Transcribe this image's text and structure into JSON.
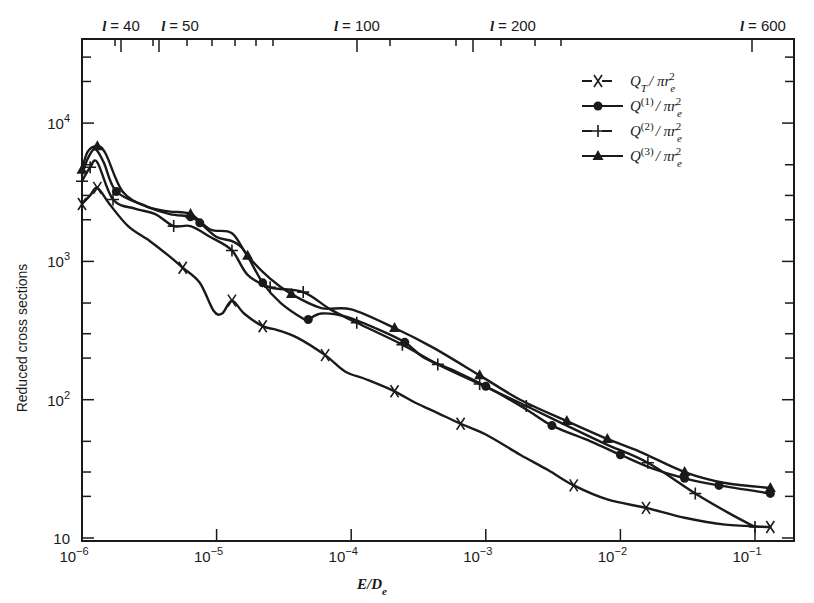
{
  "chart_data": {
    "type": "line",
    "title": "",
    "xlabel": "E/D_e",
    "ylabel": "Reduced cross sections",
    "xscale": "log",
    "yscale": "log",
    "xlim": [
      1e-06,
      0.17
    ],
    "ylim": [
      10,
      40000
    ],
    "x_ticks": [
      {
        "value": 1e-06,
        "label": "10",
        "exp": "−6"
      },
      {
        "value": 1e-05,
        "label": "10",
        "exp": "−5"
      },
      {
        "value": 0.0001,
        "label": "10",
        "exp": "−4"
      },
      {
        "value": 0.001,
        "label": "10",
        "exp": "−3"
      },
      {
        "value": 0.01,
        "label": "10",
        "exp": "−2"
      },
      {
        "value": 0.1,
        "label": "10",
        "exp": "−1"
      }
    ],
    "y_ticks": [
      {
        "value": 10,
        "label": "10",
        "exp": ""
      },
      {
        "value": 100,
        "label": "10",
        "exp": "2"
      },
      {
        "value": 1000,
        "label": "10",
        "exp": "3"
      },
      {
        "value": 10000,
        "label": "10",
        "exp": "4"
      }
    ],
    "top_axis": {
      "variable": "l",
      "labels": [
        {
          "text": "= 40",
          "x_px": 121
        },
        {
          "text": "= 50",
          "x_px": 180
        },
        {
          "text": "= 100",
          "x_px": 357
        },
        {
          "text": "= 200",
          "x_px": 513
        },
        {
          "text": "= 600",
          "x_px": 763
        }
      ],
      "ticks_px": [
        115,
        153,
        187,
        212,
        235,
        256,
        273,
        390,
        456,
        501,
        535,
        561
      ]
    },
    "legend": {
      "position": "upper right",
      "entries": [
        {
          "marker": "x",
          "label": "Q_T / πr_e²",
          "main": "Q",
          "sub": "T",
          "sup": "",
          "rest": "/ πr",
          "esub": "e",
          "esup": "2"
        },
        {
          "marker": "circle",
          "label": "Q^(1) / πr_e²",
          "main": "Q",
          "sub": "",
          "sup": "(1)",
          "rest": "/ πr",
          "esub": "e",
          "esup": "2"
        },
        {
          "marker": "plus",
          "label": "Q^(2) / πr_e²",
          "main": "Q",
          "sub": "",
          "sup": "(2)",
          "rest": "/ πr",
          "esub": "e",
          "esup": "2"
        },
        {
          "marker": "triangle",
          "label": "Q^(3) / πr_e²",
          "main": "Q",
          "sub": "",
          "sup": "(3)",
          "rest": "/ πr",
          "esub": "e",
          "esup": "2"
        }
      ]
    },
    "series": [
      {
        "name": "Q_T/πr_e²",
        "marker": "x",
        "x": [
          1e-06,
          1.15e-06,
          1.3e-06,
          1.6e-06,
          2.2e-06,
          3.2e-06,
          4.4e-06,
          5.6e-06,
          7.5e-06,
          9.5e-06,
          1.1e-05,
          1.3e-05,
          1.6e-05,
          2.2e-05,
          2.8e-05,
          4e-05,
          6.4e-05,
          9e-05,
          0.00013,
          0.00021,
          0.0003,
          0.00044,
          0.00065,
          0.001,
          0.0018,
          0.0029,
          0.0045,
          0.008,
          0.0155,
          0.03,
          0.06,
          0.13
        ],
        "y": [
          2600,
          3000,
          3400,
          2600,
          1800,
          1400,
          1100,
          900,
          700,
          440,
          420,
          520,
          420,
          340,
          320,
          280,
          210,
          160,
          140,
          115,
          95,
          80,
          67,
          56,
          40,
          31,
          24,
          19,
          16.5,
          14,
          12.5,
          12
        ]
      },
      {
        "name": "Q^(1)/πr_e²",
        "marker": "circle",
        "x": [
          1e-06,
          1.1e-06,
          1.25e-06,
          1.45e-06,
          1.8e-06,
          3e-06,
          4.5e-06,
          6.4e-06,
          7.5e-06,
          1e-05,
          1.3e-05,
          1.6e-05,
          2.2e-05,
          3e-05,
          4.5e-05,
          4.8e-05,
          6e-05,
          9e-05,
          0.00015,
          0.00025,
          0.00035,
          0.0006,
          0.001,
          0.002,
          0.0031,
          0.006,
          0.01,
          0.017,
          0.03,
          0.054,
          0.13
        ],
        "y": [
          4200,
          5500,
          6500,
          5200,
          3200,
          2500,
          2200,
          2100,
          1900,
          1500,
          1400,
          1200,
          700,
          500,
          380,
          380,
          420,
          400,
          330,
          260,
          200,
          160,
          125,
          85,
          65,
          50,
          40,
          32,
          27,
          24,
          21
        ]
      },
      {
        "name": "Q^(2)/πr_e²",
        "marker": "plus",
        "x": [
          1e-06,
          1.15e-06,
          1.3e-06,
          1.7e-06,
          2.5e-06,
          3.5e-06,
          4.8e-06,
          6.4e-06,
          9e-06,
          1.3e-05,
          1.7e-05,
          2.5e-05,
          4.4e-05,
          7e-05,
          0.00011,
          0.00024,
          0.00044,
          0.0009,
          0.002,
          0.004,
          0.0077,
          0.016,
          0.036,
          0.065,
          0.1
        ],
        "y": [
          3800,
          4800,
          5200,
          2800,
          2400,
          2200,
          1800,
          1800,
          1500,
          1200,
          800,
          650,
          600,
          450,
          360,
          250,
          180,
          130,
          90,
          65,
          48,
          35,
          21,
          15,
          12
        ]
      },
      {
        "name": "Q^(3)/πr_e²",
        "marker": "triangle",
        "x": [
          1e-06,
          1.1e-06,
          1.3e-06,
          1.5e-06,
          2e-06,
          3e-06,
          4.4e-06,
          6.4e-06,
          9e-06,
          1.3e-05,
          1.7e-05,
          2.5e-05,
          3.6e-05,
          6e-05,
          0.0001,
          0.00021,
          0.0004,
          0.0009,
          0.0018,
          0.004,
          0.008,
          0.014,
          0.03,
          0.06,
          0.13
        ],
        "y": [
          4600,
          6200,
          6800,
          6000,
          3200,
          2500,
          2300,
          2200,
          1700,
          1600,
          1100,
          750,
          580,
          460,
          450,
          330,
          240,
          150,
          100,
          70,
          52,
          42,
          30,
          25,
          23
        ]
      }
    ]
  }
}
